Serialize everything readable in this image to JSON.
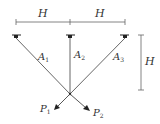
{
  "diagram": {
    "type": "truss-structure",
    "dimensions": {
      "top_left": "H",
      "top_right": "H",
      "right_vertical": "H"
    },
    "members": [
      {
        "label": "A",
        "sub": "1"
      },
      {
        "label": "A",
        "sub": "2"
      },
      {
        "label": "A",
        "sub": "3"
      }
    ],
    "loads": [
      {
        "label": "P",
        "sub": "1"
      },
      {
        "label": "P",
        "sub": "2"
      }
    ],
    "supports_count": 3,
    "colors": {
      "line": "#555555",
      "text": "#333333"
    }
  }
}
